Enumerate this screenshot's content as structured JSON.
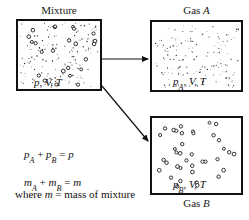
{
  "diagram": {
    "boxes": [
      {
        "id": "mixture",
        "caption": "Mixture",
        "caption_italic": "",
        "state_label": "p, V, T",
        "state_symbol": "p",
        "state_subscript": "",
        "state_rest": ", V, T"
      },
      {
        "id": "gas-a",
        "caption": "Gas ",
        "caption_italic": "A",
        "state_label": "pA, V, T",
        "state_symbol": "p",
        "state_subscript": "A",
        "state_rest": ", V, T"
      },
      {
        "id": "gas-b",
        "caption": "Gas ",
        "caption_italic": "B",
        "state_label": "pB, V, T",
        "state_symbol": "p",
        "state_subscript": "B",
        "state_rest": ", V, T"
      }
    ],
    "equations": {
      "pressure": {
        "lhs_symbol_1": "p",
        "lhs_sub_1": "A",
        "op_1": " + ",
        "lhs_symbol_2": "p",
        "lhs_sub_2": "B",
        "op_2": " = ",
        "rhs": "p",
        "plain": "pA + pB = p"
      },
      "mass": {
        "lhs_symbol_1": "m",
        "lhs_sub_1": "A",
        "op_1": " + ",
        "lhs_symbol_2": "m",
        "lhs_sub_2": "B",
        "op_2": " = ",
        "rhs": "m",
        "plain": "mA + mB = m"
      },
      "note": {
        "prefix": "where ",
        "symbol": "m",
        "suffix": " = mass of mixture",
        "plain": "where m = mass of mixture"
      }
    },
    "arrows": [
      {
        "name": "mixture-to-gas-a",
        "from": "mixture",
        "to": "gas-a",
        "direction": "right"
      },
      {
        "name": "mixture-to-gas-b",
        "from": "mixture",
        "to": "gas-b",
        "direction": "down-right"
      }
    ],
    "colors": {
      "line": "#111111",
      "text": "#1a1a1a",
      "background": "#ffffff",
      "particle_small": "#333333",
      "particle_large_stroke": "#111111"
    },
    "particles": {
      "mixture_small_count": 150,
      "mixture_large_count": 24,
      "gas_a_small_count": 150,
      "gas_b_large_count": 38
    }
  }
}
